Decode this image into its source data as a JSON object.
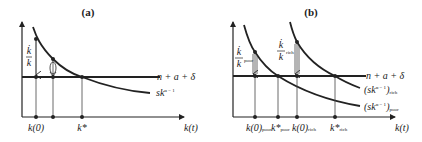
{
  "panel_a": {
    "title": "(a)",
    "y_label": {
      "numerator": "k̇",
      "denominator": "k"
    },
    "curve_label": "sk",
    "curve_label_exp": "α − 1",
    "line_label": "n + a + δ",
    "x_axis_label": "k(t)",
    "x_ticks": [
      "k(0)",
      "k*"
    ]
  },
  "panel_b": {
    "title": "(b)",
    "y_label_poor": {
      "numerator": "k̇",
      "denominator": "k",
      "sub": "poor"
    },
    "y_label_rich": {
      "numerator": "k̇",
      "denominator": "k",
      "sub": "rich"
    },
    "line_label": "n + a + δ",
    "curve_rich_label": "(sk",
    "curve_rich_exp": "α − 1",
    "curve_rich_close": ")",
    "curve_rich_sub": "rich",
    "curve_poor_label": "(sk",
    "curve_poor_exp": "α − 1",
    "curve_poor_close": ")",
    "curve_poor_sub": "poor",
    "x_axis_label": "k(t)",
    "x_ticks": [
      {
        "main": "k(0)",
        "sub": "poor"
      },
      {
        "main": "k*",
        "sub": "poor"
      },
      {
        "main": "k(0)",
        "sub": "rich"
      },
      {
        "main": "k*",
        "sub": "rich"
      }
    ]
  }
}
